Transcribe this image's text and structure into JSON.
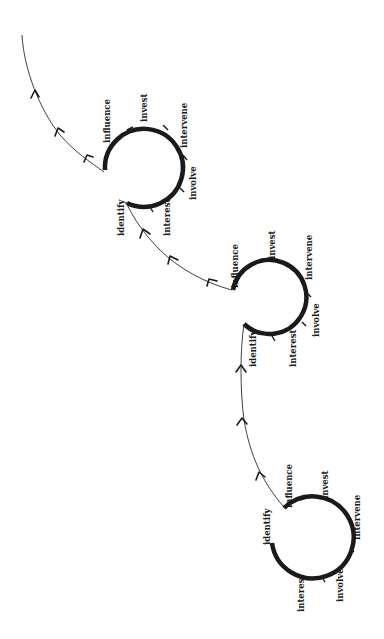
{
  "diagram": {
    "type": "spiral-cycle",
    "orientation": "rotated-90",
    "colors": {
      "stroke": "#1a1a1a",
      "background": "#ffffff"
    },
    "loops": [
      {
        "id": "loop-1",
        "labels": {
          "identify": "identify",
          "interest": "interest",
          "involve": "involve",
          "intervene": "intervene",
          "invest": "invest",
          "influence": "influence"
        }
      },
      {
        "id": "loop-2",
        "labels": {
          "identify": "identify",
          "interest": "interest",
          "involve": "involve",
          "intervene": "intervene",
          "invest": "invest",
          "influence": "influence"
        }
      },
      {
        "id": "loop-3",
        "labels": {
          "identify": "identify",
          "interest": "interest",
          "involve": "involve",
          "intervene": "intervene",
          "invest": "invest",
          "influence": "influence"
        }
      }
    ]
  }
}
